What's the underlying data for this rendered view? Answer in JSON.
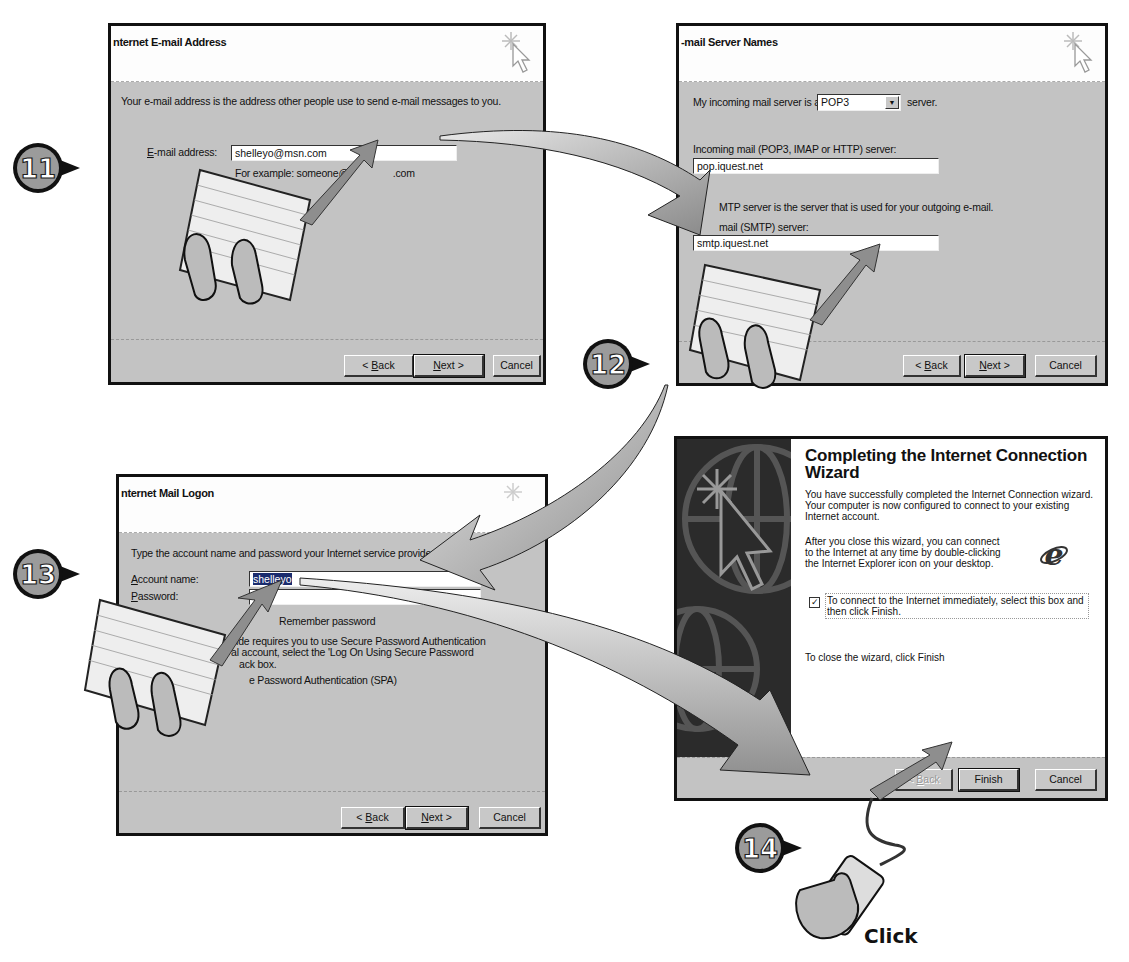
{
  "steps": [
    {
      "number": "11",
      "dialog": {
        "title": "nternet E-mail Address",
        "description": "Your e-mail address is the address other people use to send e-mail messages to you.",
        "email_label": "E-mail address:",
        "email_label_accesskey": "E",
        "email_value": "shelleyo@msn.com",
        "example_text": "For example: someone@",
        "example_suffix": ".com",
        "buttons": {
          "back": "< Back",
          "next": "Next >",
          "cancel": "Cancel"
        }
      }
    },
    {
      "number": "12",
      "dialog": {
        "title": "-mail Server Names",
        "incoming_type_prefix": "My incoming mail server is a",
        "incoming_type_value": "POP3",
        "incoming_type_suffix": "server.",
        "incoming_label": "Incoming mail (POP3, IMAP or HTTP) server:",
        "incoming_value": "pop.iquest.net",
        "smtp_note": "MTP server is the server that is used for your outgoing e-mail.",
        "outgoing_label": "mail (SMTP) server:",
        "outgoing_value": "smtp.iquest.net",
        "buttons": {
          "back": "< Back",
          "next": "Next >",
          "cancel": "Cancel"
        }
      }
    },
    {
      "number": "13",
      "dialog": {
        "title": "nternet Mail Logon",
        "description": "Type the account name and password your Internet service provider has given y",
        "account_label": "Account name:",
        "account_value": "shelleyo",
        "password_label": "Password:",
        "password_value": "",
        "remember_label": "Remember password",
        "spa_note_line1": "t service    vide   requires you to use Secure Password Authentication",
        "spa_note_line2": "al account, select the 'Log On Using Secure Password",
        "spa_note_line3": "ack box.",
        "spa_checkbox_label": "e Password Authentication (SPA)",
        "buttons": {
          "back": "< Back",
          "next": "Next >",
          "cancel": "Cancel"
        }
      }
    },
    {
      "number": "14",
      "dialog": {
        "title": "Completing the Internet Connection Wizard",
        "para1": "You have successfully completed the Internet Connection wizard. Your computer is now configured to connect to your existing Internet account.",
        "para2": "After you close this wizard, you can connect to the Internet at any time by double-clicking the Internet Explorer icon on your desktop.",
        "connect_checkbox_label": "To connect to the Internet immediately, select this box and then click Finish.",
        "connect_checked": true,
        "close_note": "To close the wizard, click Finish",
        "buttons": {
          "back": "< Back",
          "finish": "Finish",
          "cancel": "Cancel"
        }
      },
      "action_label": "Click"
    }
  ],
  "colors": {
    "dialog_bg": "#c3c3c3",
    "header_bg": "#fdfdfd",
    "arrow_gray": "#9a9a9a",
    "side_art": "#2a2a2a"
  }
}
